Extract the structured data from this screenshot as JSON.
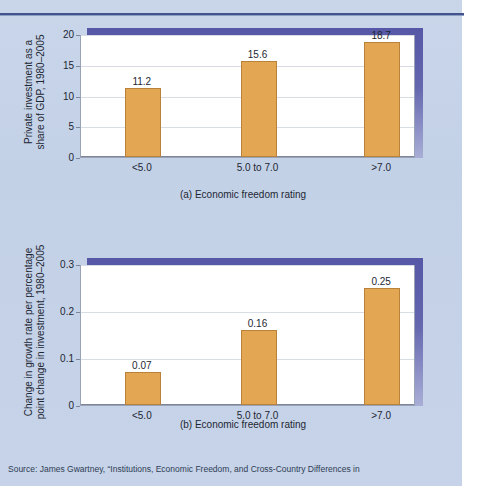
{
  "figure": {
    "background_color": "#c6d3e8",
    "accent_color": "#5b5ba8",
    "bar_color": "#e3a754",
    "bar_border_color": "#b8823a",
    "rule_color": "#43548c",
    "source_note": "Source: James Gwartney, “Institutions, Economic Freedom, and Cross-Country Differences in"
  },
  "chart_data": [
    {
      "type": "bar",
      "id": "panel-a",
      "title": "",
      "categories": [
        "<5.0",
        "5.0 to 7.0",
        ">7.0"
      ],
      "values": [
        11.2,
        15.6,
        18.7
      ],
      "value_labels": [
        "11.2",
        "15.6",
        "18.7"
      ],
      "xlabel": "(a) Economic freedom rating",
      "ylabel": "Private investment as a\nshare of GDP, 1980–2005",
      "ylabel_line1": "Private investment as a",
      "ylabel_line2": "share of GDP, 1980–2005",
      "yticks": [
        0,
        5,
        10,
        15,
        20
      ],
      "ytick_labels": [
        "0",
        "5",
        "10",
        "15",
        "20"
      ],
      "ylim": [
        0,
        20
      ],
      "grid": true,
      "legend": "none"
    },
    {
      "type": "bar",
      "id": "panel-b",
      "title": "",
      "categories": [
        "<5.0",
        "5.0 to 7.0",
        ">7.0"
      ],
      "values": [
        0.07,
        0.16,
        0.25
      ],
      "value_labels": [
        "0.07",
        "0.16",
        "0.25"
      ],
      "xlabel": "(b) Economic freedom rating",
      "ylabel": "Change in growth rate per percentage\npoint change in investment, 1980–2005",
      "ylabel_line1": "Change in growth rate per percentage",
      "ylabel_line2": "point change in investment, 1980–2005",
      "yticks": [
        0,
        0.1,
        0.2,
        0.3
      ],
      "ytick_labels": [
        "0",
        "0.1",
        "0.2",
        "0.3"
      ],
      "ylim": [
        0,
        0.3
      ],
      "grid": true,
      "legend": "none"
    }
  ]
}
